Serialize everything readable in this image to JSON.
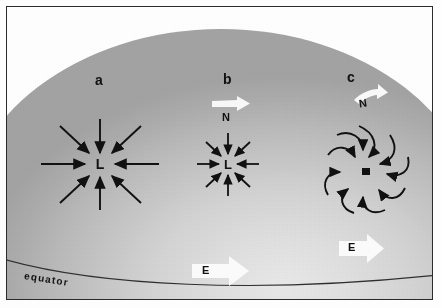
{
  "figure": {
    "background_color": "#ffffff",
    "globe_shade_light": "#e7e7e7",
    "globe_shade_dark": "#a2a2a2",
    "ink_color": "#111111",
    "white_arrow_color": "#fbfbfb"
  },
  "labels": {
    "equator": "equator"
  },
  "panels": [
    {
      "id": "a",
      "letter": "a",
      "center_label": "L",
      "arrow_count": 8,
      "arrow_style": "straight-radial-inward",
      "has_n_arrow": false,
      "has_e_arrow": false,
      "description": "Air flows straight inward toward the low centre; pressure gradient force only."
    },
    {
      "id": "b",
      "letter": "b",
      "center_label": "L",
      "arrow_count": 8,
      "arrow_style": "straight-radial-inward-short",
      "has_n_arrow": true,
      "n_label": "N",
      "has_e_arrow": true,
      "e_label": "E",
      "description": "Inward flow with northward N arrow above and eastward E arrow below."
    },
    {
      "id": "c",
      "letter": "c",
      "center_label": "L",
      "arrow_count": 9,
      "arrow_style": "curved-spiral-inward-counterclockwise",
      "has_n_arrow": true,
      "n_label": "N",
      "has_e_arrow": true,
      "e_label": "E",
      "description": "Coriolis deflection produces a counterclockwise spiral inflow into the low."
    }
  ],
  "direction_markers": [
    {
      "name": "north-arrow-b",
      "label": "N",
      "shape": "white-block-arrow-right"
    },
    {
      "name": "north-arrow-c",
      "label": "N",
      "shape": "white-curved-arrow-right-up"
    },
    {
      "name": "east-arrow-b",
      "label": "E",
      "shape": "white-block-arrow-right"
    },
    {
      "name": "east-arrow-c",
      "label": "E",
      "shape": "white-block-arrow-right"
    }
  ]
}
